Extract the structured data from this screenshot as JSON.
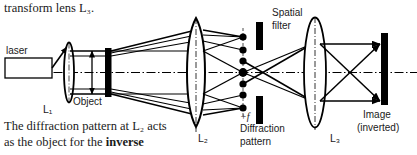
{
  "figure": {
    "type": "optical-ray-diagram",
    "title_text_above": "transform lens L₃.",
    "caption_line1": "The diffraction pattern at L₂ acts",
    "caption_line2_prefix": "as the object for the ",
    "caption_line2_bold": "inverse",
    "stroke_color": "#000000",
    "background": "#ffffff"
  },
  "labels": {
    "laser": "laser",
    "lens1": "L₁",
    "object": "Object",
    "lens2": "L₂",
    "spatial_line1": "Spatial",
    "spatial_line2": "filter",
    "focal": "+f",
    "diffraction_line1": "Diffraction",
    "diffraction_line2": "pattern",
    "lens3": "L₃",
    "image_line1": "Image",
    "image_line2": "(inverted)"
  },
  "elements": {
    "laser_box": "laser-source-box",
    "lens1_shape": "thin-convex-lens",
    "object_bar": "object-plane-black-bar",
    "lens2_shape": "thick-convex-lens",
    "diffraction_dots_count": 7,
    "filter_bars_count": 2,
    "lens3_shape": "convex-lens",
    "image_bar": "image-plane-black-bar",
    "optical_axis": "dash-dot-horizontal-axis"
  }
}
